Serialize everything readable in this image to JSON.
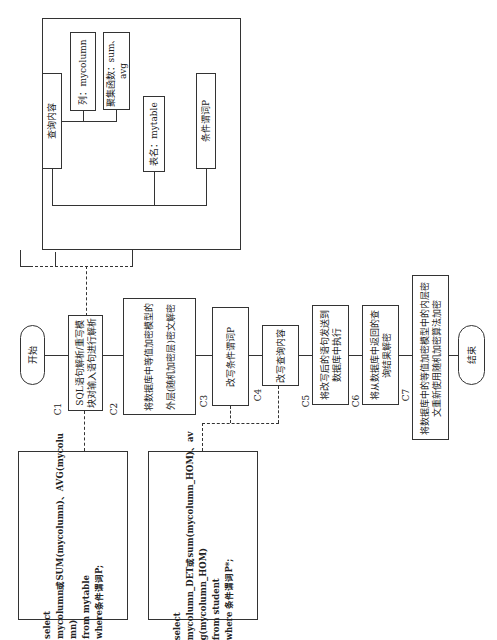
{
  "flow": {
    "start": "开始",
    "end": "结束",
    "steps": [
      {
        "id": "C1",
        "text": "SQL语句解析/重写模块对输入语句进行解析"
      },
      {
        "id": "C2",
        "text": "将数据库中等值加密模型的外层(随机加密层)密文解密"
      },
      {
        "id": "C3",
        "text": "改写条件谓词P"
      },
      {
        "id": "C4",
        "text": "改写查询内容"
      },
      {
        "id": "C5",
        "text": "将改写后的语句发送到数据库中执行"
      },
      {
        "id": "C6",
        "text": "将从数据库中返回的查询结果解密"
      },
      {
        "id": "C7",
        "text": "将数据库中的等值加密模型中的内层密文重新使用随机加密算法加密"
      }
    ]
  },
  "parse_tree": {
    "query_content": "查询内容",
    "column": "列：mycolumn",
    "aggregate": "聚集函数：sum、avg",
    "table_name": "表名：mytable",
    "predicate": "条件谓词P"
  },
  "sql_original": "select\nmycolumn或SUM(mycolumn)、AVG(mycolu\nmn)\nfrom mytable\nwhere条件谓词P;",
  "sql_rewritten": "select\nmycolumn_DET或sum(mycolumn_HOM)、av\ng(mycolumn_HOM)\nfrom student\nwhere 条件谓词P*;"
}
